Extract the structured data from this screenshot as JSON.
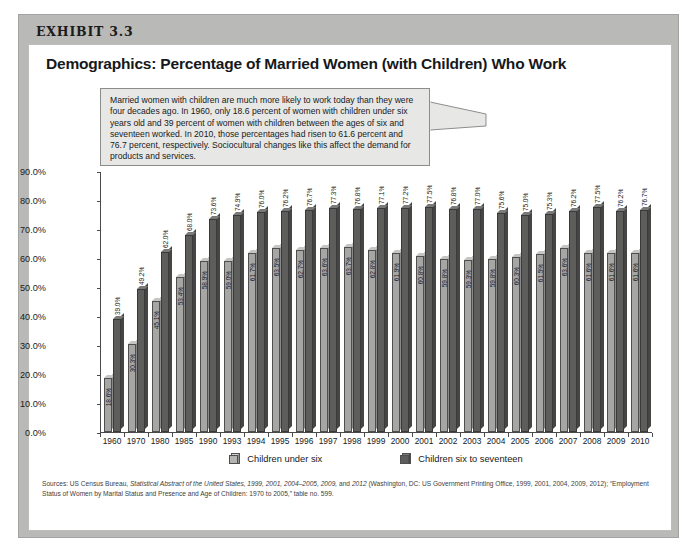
{
  "exhibit": {
    "label": "EXHIBIT 3.3"
  },
  "title": "Demographics: Percentage of Married Women (with Children) Who Work",
  "callout": {
    "text": "Married women with children are much more likely to work today than they were four decades ago. In 1960, only 18.6 percent of women with children under six years old and 39 percent of women with children between the ages of six and seventeen worked. In 2010, those percentages had risen to 61.6 percent and 76.7 percent, respectively. Sociocultural changes like this affect the demand for products and services."
  },
  "legend": {
    "items": [
      {
        "label": "Children under six",
        "color": "#a6a6a4"
      },
      {
        "label": "Children six to seventeen",
        "color": "#5d5d5b"
      }
    ]
  },
  "source": {
    "prefix": "Sources: US Census Bureau, ",
    "italic1": "Statistical Abstract of the United States, 1999, 2001, 2004–2005, 2009,",
    "mid": " and ",
    "italic2": "2012",
    "suffix": " (Washington, DC: US Government Printing Office, 1999, 2001, 2004, 2009, 2012); “Employment Status of Women by Marital Status and Presence and Age of Children: 1970 to 2005,” table no. 599."
  },
  "chart_data": {
    "type": "bar",
    "title": "Demographics: Percentage of Married Women (with Children) Who Work",
    "xlabel": "",
    "ylabel": "",
    "ylim": [
      0,
      90
    ],
    "grid": false,
    "legend_position": "bottom",
    "ytick_labels": [
      "90.0%",
      "80.0%",
      "70.0%",
      "60.0%",
      "50.0%",
      "40.0%",
      "30.0%",
      "20.0%",
      "10.0%",
      "0.0%"
    ],
    "ytick_values": [
      90,
      80,
      70,
      60,
      50,
      40,
      30,
      20,
      10,
      0
    ],
    "categories": [
      "1960",
      "1970",
      "1980",
      "1985",
      "1990",
      "1993",
      "1994",
      "1995",
      "1996",
      "1997",
      "1998",
      "1999",
      "2000",
      "2001",
      "2002",
      "2003",
      "2004",
      "2005",
      "2006",
      "2007",
      "2008",
      "2009",
      "2010"
    ],
    "series": [
      {
        "name": "Children under six",
        "color": "#a6a6a4",
        "values": [
          18.6,
          30.3,
          45.1,
          53.4,
          58.9,
          59.0,
          61.7,
          63.5,
          62.7,
          63.6,
          63.7,
          62.8,
          61.9,
          60.8,
          59.8,
          59.3,
          59.8,
          60.3,
          61.5,
          63.6,
          61.6,
          61.6,
          61.6
        ],
        "labels": [
          "18.6%",
          "30.3%",
          "45.1%",
          "53.4%",
          "58.9%",
          "59.0%",
          "61.7%",
          "63.5%",
          "62.7%",
          "63.6%",
          "63.7%",
          "62.8%",
          "61.9%",
          "60.8%",
          "59.8%",
          "59.3%",
          "59.8%",
          "60.3%",
          "61.5%",
          "63.6%",
          "61.6%",
          "61.6%",
          "61.6%"
        ]
      },
      {
        "name": "Children six to seventeen",
        "color": "#5d5d5b",
        "values": [
          39.0,
          49.2,
          62.0,
          68.0,
          73.6,
          74.9,
          76.0,
          76.2,
          76.7,
          77.3,
          76.8,
          77.1,
          77.2,
          77.5,
          76.8,
          77.0,
          75.6,
          75.0,
          75.3,
          76.2,
          77.5,
          76.2,
          76.7
        ],
        "labels": [
          "39.0%",
          "49.2%",
          "62.0%",
          "68.0%",
          "73.6%",
          "74.9%",
          "76.0%",
          "76.2%",
          "76.7%",
          "77.3%",
          "76.8%",
          "77.1%",
          "77.2%",
          "77.5%",
          "76.8%",
          "77.0%",
          "75.6%",
          "75.0%",
          "75.3%",
          "76.2%",
          "77.5%",
          "76.2%",
          "76.7%"
        ]
      }
    ]
  }
}
